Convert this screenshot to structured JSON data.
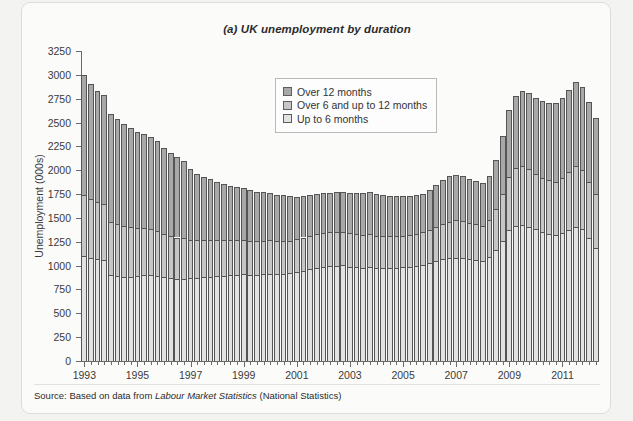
{
  "figure": {
    "title": "(a) UK unemployment by duration",
    "source_prefix": "Source: Based on data from ",
    "source_italic": "Labour Market Statistics",
    "source_suffix": " (National Statistics)"
  },
  "legend": {
    "position": "inside-top-center",
    "items": [
      {
        "label": "Over 12 months",
        "color": "#a8a8a8"
      },
      {
        "label": "Over 6 and up to 12 months",
        "color": "#c6c6c6"
      },
      {
        "label": "Up to 6 months",
        "color": "#e2e2e2"
      }
    ]
  },
  "chart_data": {
    "type": "bar",
    "stacked": true,
    "title": "(a) UK unemployment by duration",
    "xlabel": "",
    "ylabel": "Unemployment (000s)",
    "ylim": [
      0,
      3250
    ],
    "ytick_step": 250,
    "yticks": [
      0,
      250,
      500,
      750,
      1000,
      1250,
      1500,
      1750,
      2000,
      2250,
      2500,
      2750,
      3000,
      3250
    ],
    "grid": false,
    "x_tick_labels": [
      "1993",
      "1995",
      "1997",
      "1999",
      "2001",
      "2003",
      "2005",
      "2007",
      "2009",
      "2011"
    ],
    "x_tick_label_step_quarters": 8,
    "x_first_period": "1993 Q1",
    "x_period": "quarterly",
    "categories": [
      "1993Q1",
      "1993Q2",
      "1993Q3",
      "1993Q4",
      "1994Q1",
      "1994Q2",
      "1994Q3",
      "1994Q4",
      "1995Q1",
      "1995Q2",
      "1995Q3",
      "1995Q4",
      "1996Q1",
      "1996Q2",
      "1996Q3",
      "1996Q4",
      "1997Q1",
      "1997Q2",
      "1997Q3",
      "1997Q4",
      "1998Q1",
      "1998Q2",
      "1998Q3",
      "1998Q4",
      "1999Q1",
      "1999Q2",
      "1999Q3",
      "1999Q4",
      "2000Q1",
      "2000Q2",
      "2000Q3",
      "2000Q4",
      "2001Q1",
      "2001Q2",
      "2001Q3",
      "2001Q4",
      "2002Q1",
      "2002Q2",
      "2002Q3",
      "2002Q4",
      "2003Q1",
      "2003Q2",
      "2003Q3",
      "2003Q4",
      "2004Q1",
      "2004Q2",
      "2004Q3",
      "2004Q4",
      "2005Q1",
      "2005Q2",
      "2005Q3",
      "2005Q4",
      "2006Q1",
      "2006Q2",
      "2006Q3",
      "2006Q4",
      "2007Q1",
      "2007Q2",
      "2007Q3",
      "2007Q4",
      "2008Q1",
      "2008Q2",
      "2008Q3",
      "2008Q4",
      "2009Q1",
      "2009Q2",
      "2009Q3",
      "2009Q4",
      "2010Q1",
      "2010Q2",
      "2010Q3",
      "2010Q4",
      "2011Q1",
      "2011Q2",
      "2011Q3",
      "2011Q4",
      "2012Q1",
      "2012Q2"
    ],
    "series": [
      {
        "name": "Up to 6 months",
        "color": "#e2e2e2",
        "values": [
          1100,
          1080,
          1065,
          1055,
          900,
          890,
          885,
          880,
          890,
          900,
          905,
          895,
          880,
          870,
          865,
          860,
          870,
          875,
          880,
          885,
          890,
          895,
          900,
          905,
          910,
          905,
          900,
          910,
          915,
          910,
          915,
          920,
          930,
          945,
          960,
          975,
          985,
          995,
          1000,
          1005,
          990,
          985,
          980,
          985,
          975,
          970,
          975,
          980,
          985,
          990,
          1000,
          1010,
          1030,
          1050,
          1070,
          1080,
          1085,
          1080,
          1070,
          1060,
          1050,
          1090,
          1160,
          1260,
          1370,
          1420,
          1430,
          1410,
          1380,
          1350,
          1330,
          1320,
          1340,
          1370,
          1400,
          1380,
          1290,
          1180
        ]
      },
      {
        "name": "Over 6 and up to 12 months",
        "color": "#c6c6c6",
        "values": [
          640,
          620,
          600,
          590,
          560,
          545,
          530,
          520,
          500,
          490,
          480,
          470,
          450,
          440,
          430,
          425,
          400,
          390,
          385,
          380,
          375,
          370,
          368,
          365,
          360,
          358,
          355,
          352,
          350,
          348,
          345,
          342,
          345,
          350,
          355,
          360,
          360,
          358,
          355,
          352,
          350,
          348,
          345,
          342,
          340,
          338,
          335,
          332,
          330,
          332,
          335,
          340,
          345,
          355,
          365,
          380,
          390,
          385,
          380,
          375,
          370,
          390,
          430,
          490,
          560,
          600,
          610,
          600,
          580,
          570,
          565,
          560,
          580,
          610,
          640,
          620,
          590,
          570
        ]
      },
      {
        "name": "Over 12 months",
        "color": "#a8a8a8",
        "values": [
          1260,
          1200,
          1165,
          1140,
          1130,
          1105,
          1075,
          1040,
          1010,
          985,
          960,
          940,
          905,
          875,
          845,
          815,
          740,
          700,
          665,
          640,
          615,
          590,
          572,
          555,
          540,
          528,
          516,
          505,
          495,
          485,
          478,
          470,
          448,
          435,
          425,
          418,
          412,
          410,
          412,
          418,
          425,
          432,
          440,
          448,
          440,
          432,
          425,
          418,
          412,
          408,
          405,
          402,
          415,
          440,
          465,
          485,
          480,
          470,
          462,
          455,
          450,
          465,
          520,
          610,
          700,
          760,
          790,
          800,
          800,
          805,
          810,
          820,
          835,
          860,
          880,
          870,
          840,
          800
        ]
      }
    ],
    "totals_note": "Stacked totals range from about 1410 (2004-2005 trough) to about 3000 (1993 peak) and about 2620 (2011 peak)"
  },
  "axes": {
    "y_title": "Unemployment (000s)"
  }
}
